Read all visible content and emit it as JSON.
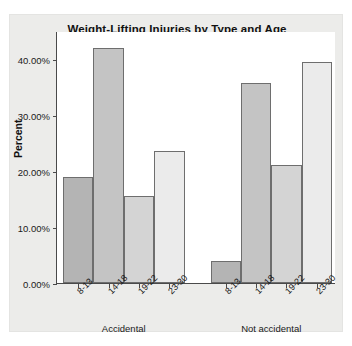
{
  "chart_data": {
    "type": "bar",
    "title": "Weight-Lifting Injuries by Type and Age",
    "xlabel": "",
    "ylabel": "Percent",
    "ylim": [
      0,
      45
    ],
    "grid": false,
    "legend": "none",
    "ytick_labels": [
      "0.00%",
      "10.00%",
      "20.00%",
      "30.00%",
      "40.00%"
    ],
    "ytick_values": [
      0,
      10,
      20,
      30,
      40
    ],
    "categories": [
      "8-13",
      "14-18",
      "19-22",
      "23-30"
    ],
    "groups": [
      "Accidental",
      "Not accidental"
    ],
    "series": [
      {
        "name": "Accidental",
        "values": [
          19.0,
          42.0,
          15.5,
          23.5
        ]
      },
      {
        "name": "Not accidental",
        "values": [
          4.0,
          35.7,
          21.0,
          39.5
        ]
      }
    ],
    "bar_colors": [
      "#b4b4b4",
      "#c4c4c4",
      "#d4d4d4",
      "#ebebeb"
    ],
    "bar_edge_color": "#6e6e6e",
    "plot_background": "#ffffff",
    "panel_background": "#ececea",
    "axis_color": "#4a4a4a"
  }
}
